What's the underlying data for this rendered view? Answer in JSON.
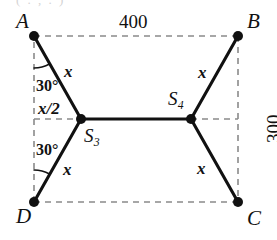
{
  "figure": {
    "kind": "geometry-diagram",
    "title_artifact": "( . , . )",
    "colors": {
      "ink": "#111111",
      "dashed": "#8a8a8a",
      "background": "#ffffff"
    },
    "rectangle": {
      "width_label": "400",
      "height_label": "300"
    },
    "vertices": [
      {
        "id": "A",
        "label": "A",
        "x": 34,
        "y": 36
      },
      {
        "id": "B",
        "label": "B",
        "x": 238,
        "y": 36
      },
      {
        "id": "C",
        "label": "C",
        "x": 238,
        "y": 202
      },
      {
        "id": "D",
        "label": "D",
        "x": 34,
        "y": 202
      }
    ],
    "steiner_points": [
      {
        "id": "S3",
        "label": "S",
        "sub": "3",
        "x": 81,
        "y": 119
      },
      {
        "id": "S4",
        "label": "S",
        "sub": "4",
        "x": 191,
        "y": 119
      }
    ],
    "edge_labels": [
      {
        "id": "x-top-left",
        "text": "x"
      },
      {
        "id": "x-top-right",
        "text": "x"
      },
      {
        "id": "x-bottom-left",
        "text": "x"
      },
      {
        "id": "x-bottom-right",
        "text": "x"
      },
      {
        "id": "x-half",
        "text": "x/2"
      }
    ],
    "angle_labels": [
      {
        "id": "angle-at-A",
        "text": "30°"
      },
      {
        "id": "angle-at-D",
        "text": "30°"
      }
    ]
  }
}
